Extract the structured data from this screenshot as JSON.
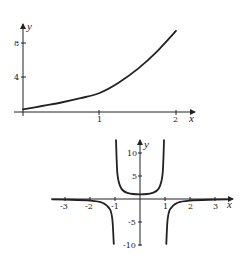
{
  "chart_data": [
    {
      "type": "line",
      "title": "",
      "xlabel": "x",
      "ylabel": "y",
      "xlim": [
        0,
        2.2
      ],
      "ylim": [
        0,
        10
      ],
      "x_ticks": [
        "1",
        "2"
      ],
      "y_ticks": [
        "4",
        "8"
      ],
      "grid": false,
      "legend": null,
      "series": [
        {
          "name": "curve",
          "x": [
            0,
            0.25,
            0.5,
            0.75,
            1.0,
            1.25,
            1.5,
            1.75,
            2.0
          ],
          "y": [
            0.3,
            0.7,
            1.1,
            1.6,
            2.2,
            3.4,
            5.0,
            7.0,
            9.4
          ]
        }
      ]
    },
    {
      "type": "line",
      "title": "",
      "xlabel": "x",
      "ylabel": "y",
      "xlim": [
        -3.5,
        3.7
      ],
      "ylim": [
        -10,
        12
      ],
      "x_ticks": [
        "-3",
        "-2",
        "-1",
        "1",
        "2",
        "3"
      ],
      "y_ticks": [
        "10",
        "5",
        "-5",
        "-10"
      ],
      "grid": false,
      "legend": null,
      "vertical_asymptotes": [
        -1,
        1
      ],
      "series": [
        {
          "name": "left branch (x < -1)",
          "x": [
            -3.5,
            -3,
            -2,
            -1.5,
            -1.2,
            -1.1,
            -1.05
          ],
          "y": [
            -0.09,
            -0.13,
            -0.33,
            -0.8,
            -2.27,
            -4.76,
            -9.76
          ]
        },
        {
          "name": "middle branch (-1 < x < 1)",
          "x": [
            -0.96,
            -0.9,
            -0.75,
            -0.5,
            0,
            0.5,
            0.75,
            0.9,
            0.96
          ],
          "y": [
            12.8,
            5.26,
            2.29,
            1.33,
            1.0,
            1.33,
            2.29,
            5.26,
            12.8
          ]
        },
        {
          "name": "right branch (x > 1)",
          "x": [
            1.05,
            1.1,
            1.2,
            1.5,
            2,
            3,
            3.5
          ],
          "y": [
            -9.76,
            -4.76,
            -2.27,
            -0.8,
            -0.33,
            -0.13,
            -0.09
          ]
        }
      ]
    }
  ],
  "labels": {
    "top": {
      "x_axis": "x",
      "y_axis": "y",
      "xt1": "1",
      "xt2": "2",
      "yt4": "4",
      "yt8": "8"
    },
    "bottom": {
      "x_axis": "x",
      "y_axis": "y",
      "xm3": "-3",
      "xm2": "-2",
      "xm1": "-1",
      "x1": "1",
      "x2": "2",
      "x3": "3",
      "y10": "10",
      "y5": "5",
      "ym5": "-5",
      "ym10": "-10"
    }
  }
}
